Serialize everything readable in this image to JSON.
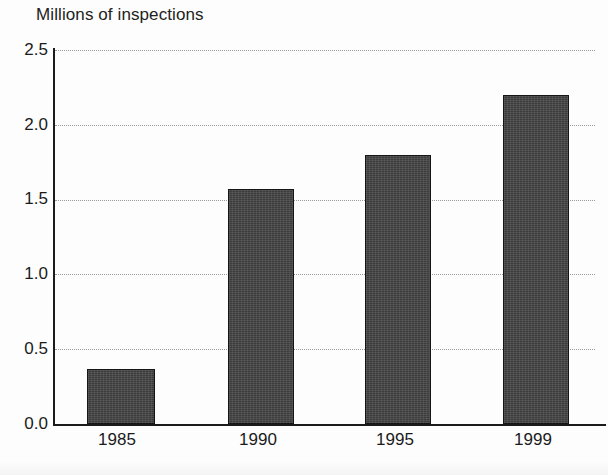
{
  "chart_data": {
    "type": "bar",
    "title": "Millions of inspections",
    "xlabel": "",
    "ylabel": "Millions of inspections",
    "categories": [
      "1985",
      "1990",
      "1995",
      "1999"
    ],
    "values": [
      0.37,
      1.57,
      1.8,
      2.2
    ],
    "series": [
      {
        "name": "Inspections",
        "values": [
          0.37,
          1.57,
          1.8,
          2.2
        ]
      }
    ],
    "ylim": [
      0.0,
      2.5
    ],
    "y_ticks": [
      "0.0",
      "0.5",
      "1.0",
      "1.5",
      "2.0",
      "2.5"
    ],
    "y_tick_values": [
      0.0,
      0.5,
      1.0,
      1.5,
      2.0,
      2.5
    ],
    "grid": true,
    "grid_style": "dotted-horizontal",
    "legend": false,
    "legend_position": "none",
    "colors": {
      "bar_fill": "#3c3c3c",
      "bar_outline": "#151515",
      "axis": "#1b1b1b",
      "gridline": "#9a9a9a",
      "text": "#1b1b1b",
      "background": "#fdfdfd"
    }
  }
}
